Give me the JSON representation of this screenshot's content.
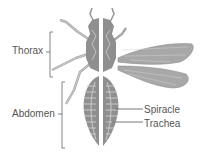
{
  "diagram": {
    "labels": {
      "thorax": "Thorax",
      "abdomen": "Abdomen",
      "spiracle": "Spiracle",
      "trachea": "Trachea"
    },
    "colors": {
      "body": "#9a9a9a",
      "body_dark": "#7f7f7f",
      "body_light": "#c4c4c4",
      "wing": "#a8a8a8",
      "label_text": "#555555",
      "leader_line": "#666666",
      "background": "#ffffff"
    }
  }
}
